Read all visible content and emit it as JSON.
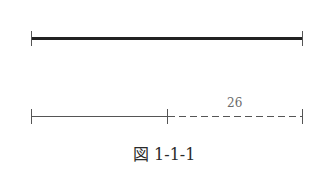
{
  "diagram": {
    "segments": [
      {
        "id": "full-segment",
        "style": "thick-solid",
        "x1": 31,
        "x2": 302,
        "y": 38
      },
      {
        "id": "known-part",
        "style": "thin-solid",
        "x1": 31,
        "x2": 167,
        "y": 116
      },
      {
        "id": "unknown-part",
        "style": "dashed",
        "x1": 167,
        "x2": 302,
        "y": 116
      }
    ],
    "dashed_label": "26",
    "caption": "図 1-1-1"
  },
  "colors": {
    "thick_line": "#222222",
    "thin_line": "#555555",
    "label": "#6a6a6a",
    "caption": "#2a2a2a"
  }
}
